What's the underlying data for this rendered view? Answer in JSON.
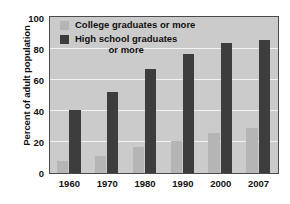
{
  "chart_data": {
    "type": "bar",
    "title": "",
    "xlabel": "",
    "ylabel": "Percent of adult population",
    "categories": [
      "1960",
      "1970",
      "1980",
      "1990",
      "2000",
      "2007"
    ],
    "series": [
      {
        "name": "College graduates or more",
        "color": "#b5b5b5",
        "values": [
          8,
          11,
          17,
          21,
          26,
          29
        ]
      },
      {
        "name": "High school graduates or more",
        "color": "#3d3d3d",
        "values": [
          41,
          52,
          67,
          77,
          84,
          86
        ]
      }
    ],
    "ylim": [
      0,
      100
    ],
    "yticks": [
      0,
      20,
      40,
      60,
      80,
      100
    ],
    "ytick_labels": [
      "0",
      "20",
      "40",
      "60",
      "80",
      "100"
    ],
    "grid": true,
    "grid_color": "#f2f2f2",
    "legend_position": "top-center-inside",
    "plot_background": "#cbcbcb",
    "border_color": "#4a4a4a"
  },
  "legend": {
    "entries": [
      {
        "label": "College graduates or more",
        "label_line1": "College graduates or more",
        "label_line2": ""
      },
      {
        "label": "High school graduates or more",
        "label_line1": "High school graduates",
        "label_line2": "or more"
      }
    ]
  },
  "axis": {
    "y_title": "Percent of adult population"
  }
}
